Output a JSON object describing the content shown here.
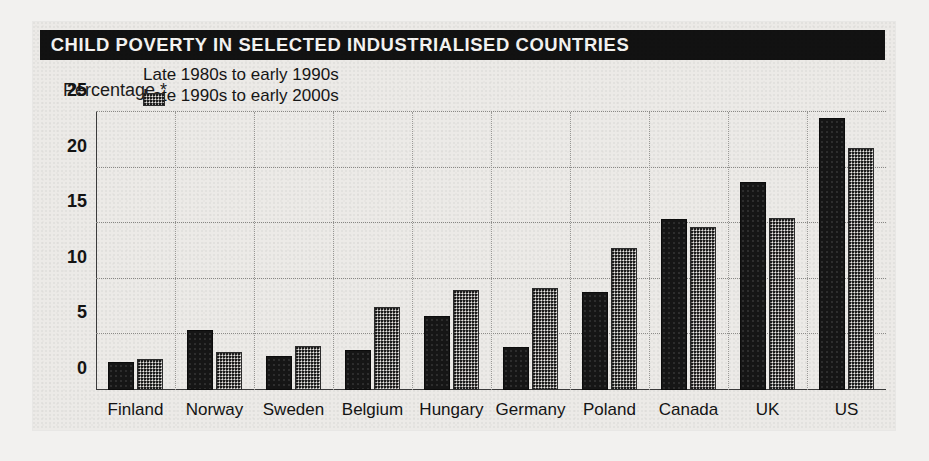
{
  "figure": {
    "title": "CHILD POVERTY IN SELECTED INDUSTRIALISED COUNTRIES",
    "y_axis_title": "Percentage *",
    "title_background": "#121212",
    "title_color": "#f5f4f2",
    "card_background": "#eceae7",
    "page_background": "#f2f1ef"
  },
  "legend": {
    "position": "upper-left-inside",
    "entries": [
      {
        "label": "Late 1980s to early 1990s",
        "color": "#161616",
        "pattern": "solid-dark"
      },
      {
        "label": "Late 1990s to early 2000s",
        "color": "#6d6c6a",
        "pattern": "dithered-grey"
      }
    ]
  },
  "chart_data": {
    "type": "bar",
    "title": "CHILD POVERTY IN SELECTED INDUSTRIALISED COUNTRIES",
    "subtitle": "",
    "xlabel": "",
    "ylabel": "Percentage *",
    "ylim": [
      0,
      25
    ],
    "yticks": [
      0,
      5,
      10,
      15,
      20,
      25
    ],
    "ytick_labels": [
      "0",
      "5",
      "10",
      "15",
      "20",
      "25"
    ],
    "grid": true,
    "grid_style": "dotted",
    "legend_position": "upper left",
    "categories": [
      "Finland",
      "Norway",
      "Sweden",
      "Belgium",
      "Hungary",
      "Germany",
      "Poland",
      "Canada",
      "UK",
      "US"
    ],
    "series": [
      {
        "name": "Late 1980s to early 1990s",
        "color": "#161616",
        "values": [
          2.5,
          5.4,
          3.1,
          3.6,
          6.7,
          3.9,
          8.8,
          15.4,
          18.7,
          24.5
        ]
      },
      {
        "name": "Late 1990s to early 2000s",
        "color": "#6d6c6a",
        "values": [
          2.8,
          3.4,
          4.0,
          7.5,
          9.0,
          9.2,
          12.8,
          14.7,
          15.5,
          21.8
        ]
      }
    ],
    "annotations": [
      "* asterisk footnote marker on axis label 'Percentage *'"
    ]
  }
}
